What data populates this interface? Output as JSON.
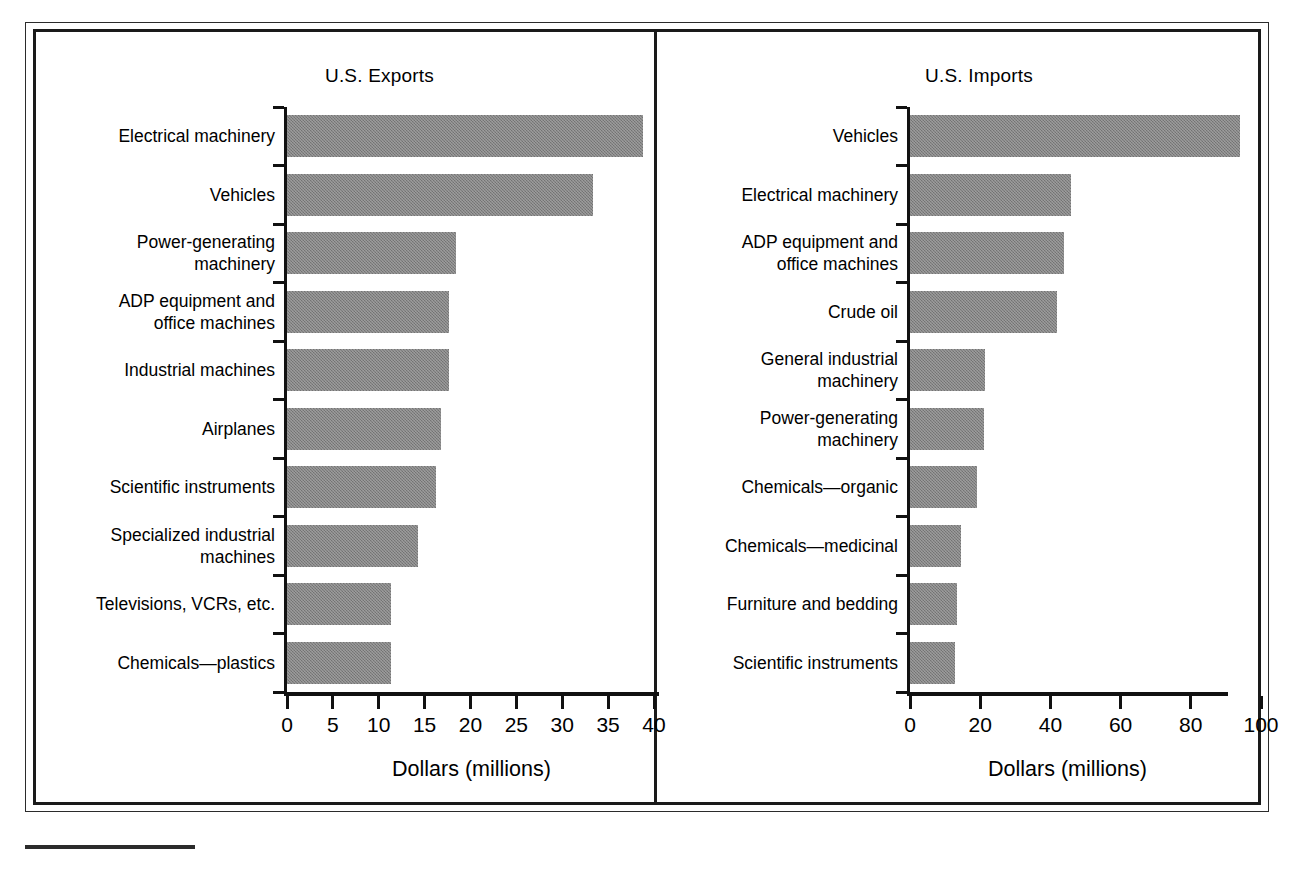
{
  "figure": {
    "panel_divider": true,
    "bar_color": "#808080",
    "axis_color": "#111111",
    "frame_color": "#1a1a1a"
  },
  "chart_data": [
    {
      "type": "bar",
      "orientation": "horizontal",
      "title": "U.S. Exports",
      "xlabel": "Dollars (millions)",
      "ylabel": "",
      "xlim": [
        0,
        40
      ],
      "xticks": [
        0,
        5,
        10,
        15,
        20,
        25,
        30,
        35,
        40
      ],
      "xticklabels": [
        "0",
        "5",
        "10",
        "15",
        "20",
        "25",
        "30",
        "35",
        "40"
      ],
      "grid": false,
      "legend": false,
      "categories": [
        "Electrical machinery",
        "Vehicles",
        "Power-generating\nmachinery",
        "ADP equipment and\noffice machines",
        "Industrial machines",
        "Airplanes",
        "Scientific instruments",
        "Specialized industrial\nmachines",
        "Televisions, VCRs, etc.",
        "Chemicals—plastics"
      ],
      "values": [
        38.8,
        33.3,
        18.4,
        17.7,
        17.7,
        16.8,
        16.2,
        14.3,
        11.3,
        11.3
      ]
    },
    {
      "type": "bar",
      "orientation": "horizontal",
      "title": "U.S. Imports",
      "xlabel": "Dollars (millions)",
      "ylabel": "",
      "xlim": [
        0,
        100
      ],
      "xticks": [
        0,
        20,
        40,
        60,
        80,
        100
      ],
      "xticklabels": [
        "0",
        "20",
        "40",
        "60",
        "80",
        "100"
      ],
      "grid": false,
      "legend": false,
      "categories": [
        "Vehicles",
        "Electrical machinery",
        "ADP equipment and\noffice machines",
        "Crude oil",
        "General industrial\nmachinery",
        "Power-generating\nmachinery",
        "Chemicals—organic",
        "Chemicals—medicinal",
        "Furniture and bedding",
        "Scientific instruments"
      ],
      "values": [
        94.0,
        45.8,
        43.9,
        42.0,
        21.5,
        21.0,
        19.0,
        14.5,
        13.5,
        12.8
      ]
    }
  ]
}
